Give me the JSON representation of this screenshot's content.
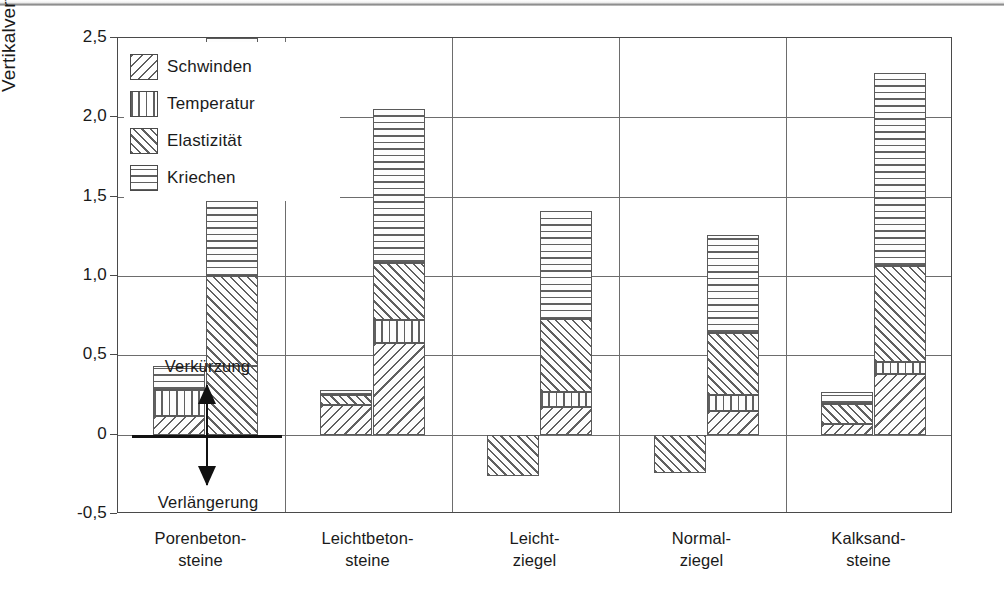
{
  "chart_data": {
    "type": "bar",
    "subtype": "grouped-stacked",
    "title": "",
    "xlabel": "",
    "ylabel": "Vertikalverformung Δℓ [mm/m]",
    "ylabel_parts": {
      "prefix": "Vertikalverformung ",
      "symbol": "Δℓ",
      "suffix": " [mm/m]"
    },
    "ylim": [
      -0.5,
      2.5
    ],
    "yticks": [
      2.5,
      2.0,
      1.5,
      1.0,
      0.5,
      0.0,
      -0.5
    ],
    "ytick_labels": [
      "2,5",
      "2,0",
      "1,5",
      "1,0",
      "0,5",
      "0",
      "-0,5"
    ],
    "grid": "horizontal-and-vertical-category-separators",
    "legend_position": "top-left-inside",
    "legend": [
      {
        "key": "schwinden",
        "label": "Schwinden",
        "pattern": "diagonal-backslash"
      },
      {
        "key": "temperatur",
        "label": "Temperatur",
        "pattern": "vertical-lines"
      },
      {
        "key": "elastizitaet",
        "label": "Elastizität",
        "pattern": "diagonal-slash"
      },
      {
        "key": "kriechen",
        "label": "Kriechen",
        "pattern": "horizontal-lines"
      }
    ],
    "categories": [
      {
        "label": "Porenbeton-\nsteine",
        "line1": "Porenbeton-",
        "line2": "steine"
      },
      {
        "label": "Leichtbeton-\nsteine",
        "line1": "Leichtbeton-",
        "line2": "steine"
      },
      {
        "label": "Leicht-\nziegel",
        "line1": "Leicht-",
        "line2": "ziegel"
      },
      {
        "label": "Normal-\nziegel",
        "line1": "Normal-",
        "line2": "ziegel"
      },
      {
        "label": "Kalksand-\nsteine",
        "line1": "Kalksand-",
        "line2": "steine"
      }
    ],
    "annotations": [
      {
        "name": "verkuerzung",
        "text": "Verkürzung",
        "position": "above-zero-line"
      },
      {
        "name": "verlaengerung",
        "text": "Verlängerung",
        "position": "below-zero-line"
      },
      {
        "name": "zero-double-arrow",
        "text": "",
        "position": "at-zero-line"
      }
    ],
    "groups": [
      {
        "category": "Porenbeton-steine",
        "bars": [
          {
            "name": "min",
            "segments": [
              {
                "key": "schwinden",
                "from": 0.0,
                "to": 0.12
              },
              {
                "key": "temperatur",
                "from": 0.12,
                "to": 0.28
              },
              {
                "key": "kriechen",
                "from": 0.28,
                "to": 0.43
              }
            ]
          },
          {
            "name": "max",
            "segments": [
              {
                "key": "elastizitaet",
                "from": 0.0,
                "to": 0.43
              },
              {
                "key": "elastizitaet",
                "from": 0.43,
                "to": 1.0
              },
              {
                "key": "kriechen",
                "from": 1.0,
                "to": 2.5
              }
            ]
          }
        ]
      },
      {
        "category": "Leichtbeton-steine",
        "bars": [
          {
            "name": "min",
            "segments": [
              {
                "key": "schwinden",
                "from": 0.0,
                "to": 0.19
              },
              {
                "key": "elastizitaet",
                "from": 0.19,
                "to": 0.25
              },
              {
                "key": "kriechen",
                "from": 0.25,
                "to": 0.28
              }
            ]
          },
          {
            "name": "max",
            "segments": [
              {
                "key": "schwinden",
                "from": 0.0,
                "to": 0.58
              },
              {
                "key": "temperatur",
                "from": 0.58,
                "to": 0.72
              },
              {
                "key": "elastizitaet",
                "from": 0.72,
                "to": 1.08
              },
              {
                "key": "kriechen",
                "from": 1.08,
                "to": 2.05
              }
            ]
          }
        ]
      },
      {
        "category": "Leicht-ziegel",
        "bars": [
          {
            "name": "min",
            "segments": [
              {
                "key": "elastizitaet",
                "from": 0.0,
                "to": -0.26
              }
            ]
          },
          {
            "name": "max",
            "segments": [
              {
                "key": "schwinden",
                "from": 0.0,
                "to": 0.175
              },
              {
                "key": "temperatur",
                "from": 0.175,
                "to": 0.27
              },
              {
                "key": "elastizitaet",
                "from": 0.27,
                "to": 0.73
              },
              {
                "key": "kriechen",
                "from": 0.73,
                "to": 1.41
              }
            ]
          }
        ]
      },
      {
        "category": "Normal-ziegel",
        "bars": [
          {
            "name": "min",
            "segments": [
              {
                "key": "elastizitaet",
                "from": 0.0,
                "to": -0.24
              }
            ]
          },
          {
            "name": "max",
            "segments": [
              {
                "key": "schwinden",
                "from": 0.0,
                "to": 0.15
              },
              {
                "key": "temperatur",
                "from": 0.15,
                "to": 0.25
              },
              {
                "key": "elastizitaet",
                "from": 0.25,
                "to": 0.64
              },
              {
                "key": "kriechen",
                "from": 0.64,
                "to": 1.26
              }
            ]
          }
        ]
      },
      {
        "category": "Kalksand-steine",
        "bars": [
          {
            "name": "min",
            "segments": [
              {
                "key": "schwinden",
                "from": 0.0,
                "to": 0.07
              },
              {
                "key": "elastizitaet",
                "from": 0.07,
                "to": 0.195
              },
              {
                "key": "kriechen",
                "from": 0.195,
                "to": 0.27
              }
            ]
          },
          {
            "name": "max",
            "segments": [
              {
                "key": "schwinden",
                "from": 0.0,
                "to": 0.38
              },
              {
                "key": "temperatur",
                "from": 0.38,
                "to": 0.46
              },
              {
                "key": "elastizitaet",
                "from": 0.46,
                "to": 1.06
              },
              {
                "key": "kriechen",
                "from": 1.06,
                "to": 2.28
              }
            ]
          }
        ]
      }
    ],
    "colors": {
      "axis": "#4a4a4a",
      "grid": "#6d6d6d",
      "hatch": "#606060",
      "text": "#1a1a1a",
      "background": "#ffffff"
    }
  }
}
